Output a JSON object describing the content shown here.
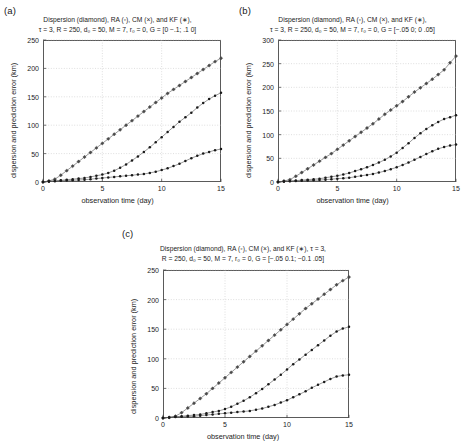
{
  "figure": {
    "panels": [
      {
        "label": "(a)",
        "title_lines": [
          "Dispersion (diamond), RA (◦), CM (×), and KF (∗),",
          "τ = 3, R = 250, d₀ = 50, M = 7, r₀ = 0, G = [0 −.1; .1 0]"
        ],
        "chart_data": {
          "type": "line",
          "title": "Dispersion (diamond), RA (◦), CM (×), and KF (∗), τ=3, R=250, d0=50, M=7, r0=0, G=[0 -.1; .1 0]",
          "xlabel": "observation time (day)",
          "ylabel": "dispersion and  prediction error (km)",
          "xlim": [
            0,
            15
          ],
          "ylim": [
            0,
            250
          ],
          "xticks": [
            0,
            5,
            10,
            15
          ],
          "yticks": [
            0,
            50,
            100,
            150,
            200,
            250
          ],
          "grid": true,
          "legend": [
            "Dispersion (diamond)",
            "RA (◦)",
            "CM (×)",
            "KF (∗)"
          ],
          "x": [
            0,
            0.5,
            1,
            1.5,
            2,
            2.5,
            3,
            3.5,
            4,
            4.5,
            5,
            5.5,
            6,
            6.5,
            7,
            7.5,
            8,
            8.5,
            9,
            9.5,
            10,
            10.5,
            11,
            11.5,
            12,
            12.5,
            13,
            13.5,
            14,
            14.5,
            15
          ],
          "series": [
            {
              "name": "Dispersion (diamond)",
              "marker": "diamond",
              "values": [
                0,
                2,
                5,
                12,
                20,
                28,
                36,
                44,
                52,
                60,
                68,
                76,
                84,
                92,
                100,
                108,
                116,
                124,
                132,
                140,
                148,
                156,
                163,
                170,
                177,
                184,
                191,
                198,
                205,
                212,
                218
              ]
            },
            {
              "name": "CM (×)",
              "marker": "cross",
              "values": [
                0,
                1,
                2,
                3,
                4,
                5,
                6,
                7,
                9,
                11,
                13,
                16,
                20,
                25,
                31,
                38,
                45,
                53,
                61,
                70,
                79,
                88,
                97,
                106,
                114,
                122,
                131,
                139,
                146,
                152,
                157
              ]
            },
            {
              "name": "KF (∗)",
              "marker": "star",
              "values": [
                0,
                1,
                1.5,
                2,
                2.5,
                3,
                3.5,
                4,
                5,
                6,
                7,
                8,
                9,
                10,
                11,
                12,
                13,
                14,
                16,
                18,
                21,
                24,
                28,
                32,
                37,
                42,
                46,
                50,
                53,
                56,
                58
              ]
            }
          ]
        }
      },
      {
        "label": "(b)",
        "title_lines": [
          "Dispersion (diamond), RA (◦), CM (×), and KF (∗),",
          "τ = 3, R = 250, d₀ = 50, M = 7, r₀ = 0, G = [−.05 0; 0 .05]"
        ],
        "chart_data": {
          "type": "line",
          "title": "Dispersion (diamond), RA (◦), CM (×), and KF (∗), τ=3, R=250, d0=50, M=7, r0=0, G=[-.05 0; 0 .05]",
          "xlabel": "observation time (day)",
          "ylabel": "dispersion and  prediction error (km)",
          "xlim": [
            0,
            15
          ],
          "ylim": [
            0,
            300
          ],
          "xticks": [
            0,
            5,
            10,
            15
          ],
          "yticks": [
            0,
            50,
            100,
            150,
            200,
            250,
            300
          ],
          "grid": true,
          "legend": [
            "Dispersion (diamond)",
            "RA (◦)",
            "CM (×)",
            "KF (∗)"
          ],
          "x": [
            0,
            0.5,
            1,
            1.5,
            2,
            2.5,
            3,
            3.5,
            4,
            4.5,
            5,
            5.5,
            6,
            6.5,
            7,
            7.5,
            8,
            8.5,
            9,
            9.5,
            10,
            10.5,
            11,
            11.5,
            12,
            12.5,
            13,
            13.5,
            14,
            14.5,
            15
          ],
          "series": [
            {
              "name": "Dispersion (diamond)",
              "marker": "diamond",
              "values": [
                0,
                2,
                5,
                12,
                20,
                28,
                36,
                44,
                52,
                60,
                69,
                78,
                87,
                96,
                105,
                114,
                123,
                133,
                143,
                152,
                161,
                170,
                180,
                190,
                199,
                208,
                217,
                227,
                237,
                252,
                266
              ]
            },
            {
              "name": "CM (×)",
              "marker": "cross",
              "values": [
                0,
                1,
                2,
                3,
                4,
                5,
                6,
                7,
                9,
                11,
                13,
                16,
                19,
                23,
                27,
                31,
                36,
                41,
                47,
                54,
                62,
                72,
                82,
                93,
                103,
                112,
                120,
                127,
                133,
                137,
                141
              ]
            },
            {
              "name": "KF (∗)",
              "marker": "star",
              "values": [
                0,
                1,
                1.5,
                2,
                2.5,
                3,
                3.5,
                4,
                5,
                6,
                7,
                8,
                9,
                11,
                13,
                15,
                17,
                20,
                23,
                27,
                31,
                36,
                41,
                47,
                53,
                59,
                65,
                70,
                74,
                77,
                79
              ]
            }
          ]
        }
      },
      {
        "label": "(c)",
        "title_lines": [
          "Dispersion (diamond), RA (◦), CM (×), and KF (∗), τ = 3,",
          "R = 250, d₀ = 50, M = 7, r₀ = 0, G = [−.05 0.1; −0.1 .05]"
        ],
        "chart_data": {
          "type": "line",
          "title": "Dispersion (diamond), RA (◦), CM (×), and KF (∗), τ=3, R=250, d0=50, M=7, r0=0, G=[-.05 0.1; -0.1 .05]",
          "xlabel": "observation time (day)",
          "ylabel": "dispersion and  prediction error (km)",
          "xlim": [
            0,
            15
          ],
          "ylim": [
            0,
            250
          ],
          "xticks": [
            0,
            5,
            10,
            15
          ],
          "yticks": [
            0,
            50,
            100,
            150,
            200,
            250
          ],
          "grid": true,
          "legend": [
            "Dispersion (diamond)",
            "RA (◦)",
            "CM (×)",
            "KF (∗)"
          ],
          "x": [
            0,
            0.5,
            1,
            1.5,
            2,
            2.5,
            3,
            3.5,
            4,
            4.5,
            5,
            5.5,
            6,
            6.5,
            7,
            7.5,
            8,
            8.5,
            9,
            9.5,
            10,
            10.5,
            11,
            11.5,
            12,
            12.5,
            13,
            13.5,
            14,
            14.5,
            15
          ],
          "series": [
            {
              "name": "Dispersion (diamond)",
              "marker": "diamond",
              "values": [
                0,
                1,
                3,
                9,
                17,
                25,
                33,
                41,
                50,
                59,
                68,
                77,
                86,
                95,
                104,
                113,
                122,
                131,
                140,
                149,
                158,
                167,
                176,
                185,
                193,
                201,
                209,
                217,
                225,
                232,
                238
              ]
            },
            {
              "name": "CM (×)",
              "marker": "cross",
              "values": [
                0,
                1,
                2,
                3,
                4,
                5,
                6,
                8,
                10,
                12,
                15,
                19,
                24,
                29,
                35,
                42,
                49,
                57,
                65,
                73,
                82,
                91,
                99,
                107,
                115,
                123,
                131,
                139,
                146,
                151,
                154
              ]
            },
            {
              "name": "KF (∗)",
              "marker": "star",
              "values": [
                0,
                1,
                1.5,
                2,
                2.5,
                3,
                4,
                5,
                6,
                7,
                8,
                9,
                10,
                11,
                12,
                14,
                16,
                19,
                22,
                26,
                30,
                35,
                40,
                45,
                51,
                56,
                61,
                66,
                70,
                72,
                73
              ]
            }
          ]
        }
      }
    ]
  }
}
